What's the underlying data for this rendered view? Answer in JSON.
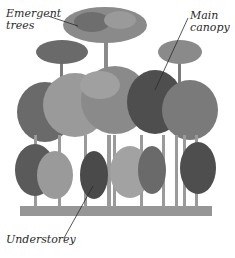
{
  "diagram": {
    "type": "rainforest-layers",
    "labels": [
      {
        "id": "emergent",
        "line1": "Emergent",
        "line2": "trees"
      },
      {
        "id": "canopy",
        "line1": "Main",
        "line2": "canopy"
      },
      {
        "id": "understorey",
        "line1": "Understorey",
        "line2": ""
      }
    ],
    "colors": {
      "foliage_dark": "#4a4a4a",
      "foliage_mid": "#7a7a7a",
      "foliage_light": "#a8a8a8",
      "trunk": "#8a8a8a",
      "ink": "#2a2a2a",
      "background": "#ffffff"
    }
  }
}
